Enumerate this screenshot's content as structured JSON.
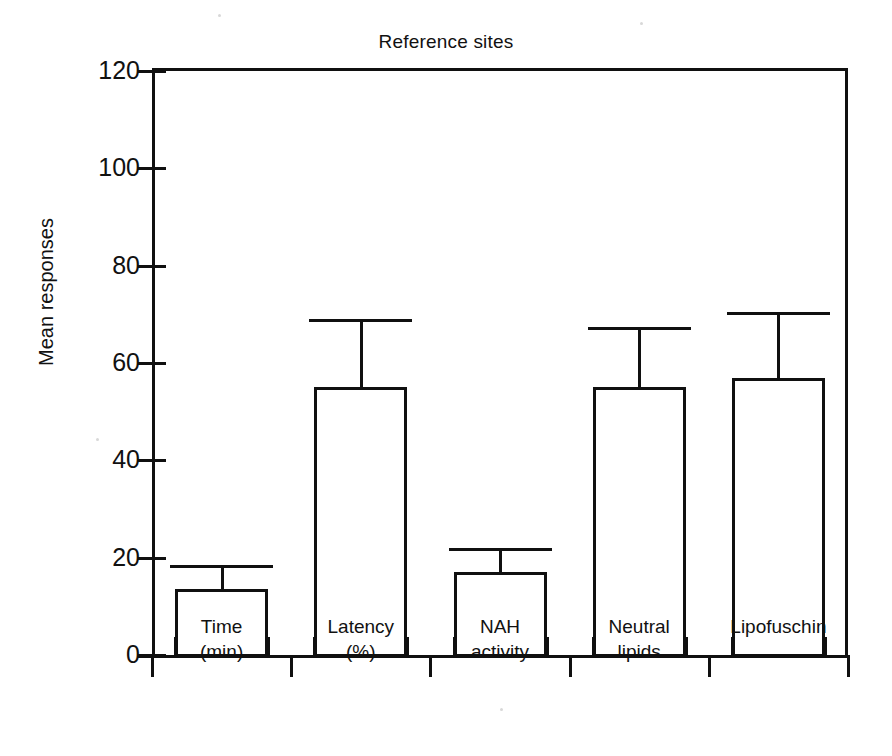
{
  "figure": {
    "title": "Reference sites",
    "ylabel": "Mean responses"
  },
  "chart_data": {
    "type": "bar",
    "title": "Reference sites",
    "xlabel": "",
    "ylabel": "Mean responses",
    "ylim": [
      0,
      120
    ],
    "ytick_labels": [
      "0",
      "20",
      "40",
      "60",
      "80",
      "100",
      "120"
    ],
    "yticks": [
      0,
      20,
      40,
      60,
      80,
      100,
      120
    ],
    "grid": false,
    "legend": null,
    "categories": [
      "Time\n(min)",
      "Latency\n(%)",
      "NAH\nactivity",
      "Neutral\nlipids",
      "Lipofuschin"
    ],
    "values": [
      13.5,
      55,
      17,
      55,
      57
    ],
    "errors_upper": [
      18.5,
      69,
      22,
      67.5,
      70.5
    ],
    "error_bar_style": "upper-only-with-cap",
    "bars": [
      {
        "label": "Time\n(min)",
        "value": 13.5,
        "error_top": 18.5
      },
      {
        "label": "Latency\n(%)",
        "value": 55,
        "error_top": 69
      },
      {
        "label": "NAH\nactivity",
        "value": 17,
        "error_top": 22
      },
      {
        "label": "Neutral\nlipids",
        "value": 55,
        "error_top": 67.5
      },
      {
        "label": "Lipofuschin",
        "value": 57,
        "error_top": 70.5
      }
    ]
  },
  "colors": {
    "ink": "#101010",
    "background": "#ffffff"
  }
}
